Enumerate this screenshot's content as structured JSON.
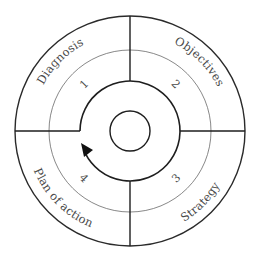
{
  "diagram": {
    "type": "cycle",
    "center": [
      130,
      131
    ],
    "radii": {
      "core": 20,
      "cycle_arc": 50,
      "number_ring": 81,
      "outer": 115
    },
    "quadrants": [
      {
        "number": "1",
        "label": "Diagnosis",
        "position": "top-left"
      },
      {
        "number": "2",
        "label": "Objectives",
        "position": "top-right"
      },
      {
        "number": "3",
        "label": "Strategy",
        "position": "bottom-right"
      },
      {
        "number": "4",
        "label": "Plan of action",
        "position": "bottom-left"
      }
    ],
    "flow": "clockwise",
    "colors": {
      "line": "#1e1e1e",
      "thin_line": "#6a6a6a",
      "text": "#4a4a4a",
      "background": "#ffffff"
    }
  }
}
